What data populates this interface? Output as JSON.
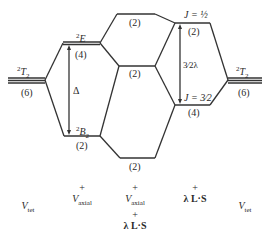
{
  "diagram": {
    "left_state": {
      "term": "²T₂",
      "term_base": "T",
      "term_sup": "2",
      "term_sub": "2",
      "degeneracy": "(6)"
    },
    "axial_levels": [
      {
        "term_sup": "2",
        "term_base": "E",
        "degeneracy": "(4)"
      },
      {
        "term_sup": "2",
        "term_base": "B",
        "term_sub": "2",
        "degeneracy": "(2)"
      }
    ],
    "splitting_label": "Δ",
    "combined_levels": [
      {
        "degeneracy": "(2)"
      },
      {
        "degeneracy": "(2)"
      },
      {
        "degeneracy": "(2)"
      }
    ],
    "spin_orbit_levels": [
      {
        "label": "J = ½",
        "degeneracy": "(2)"
      },
      {
        "label": "J = 3⁄2",
        "degeneracy": "(4)"
      }
    ],
    "spin_orbit_splitting": "3⁄2λ",
    "right_state": {
      "term_sup": "2",
      "term_base": "T",
      "term_sub": "2",
      "degeneracy": "(6)"
    },
    "columns": [
      {
        "line1": "",
        "V": "V",
        "sub": "tet",
        "plus2": "",
        "ls": ""
      },
      {
        "line1": "+",
        "V": "V",
        "sub": "axial",
        "plus2": "",
        "ls": ""
      },
      {
        "line1": "+",
        "V": "V",
        "sub": "axial",
        "plus2": "+",
        "ls": "λ L·S"
      },
      {
        "line1": "+",
        "V": "",
        "sub": "",
        "plus2": "",
        "ls": "λ L·S"
      },
      {
        "line1": "",
        "V": "V",
        "sub": "tet",
        "plus2": "",
        "ls": ""
      }
    ]
  }
}
